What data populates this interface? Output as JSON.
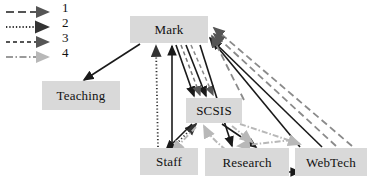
{
  "figure": {
    "type": "directed-graph-diagram",
    "background": "#ffffff",
    "node_fill": "#d9d9d9",
    "edge_dark": "#1a1a1a",
    "edge_gray": "#9a9a9a",
    "edge_light_gray": "#b8b8b8"
  },
  "legend": {
    "entries": [
      {
        "label": "1",
        "style": "long-dash",
        "color": "#555555"
      },
      {
        "label": "2",
        "style": "dotted",
        "color": "#333333"
      },
      {
        "label": "3",
        "style": "dashed",
        "color": "#555555"
      },
      {
        "label": "4",
        "style": "dash-dot",
        "color": "#9a9a9a"
      }
    ]
  },
  "nodes": [
    {
      "id": "mark",
      "label": "Mark",
      "x": 130,
      "y": 16,
      "w": 78,
      "h": 27
    },
    {
      "id": "teaching",
      "label": "Teaching",
      "x": 42,
      "y": 81,
      "w": 78,
      "h": 29
    },
    {
      "id": "scsis",
      "label": "SCSIS",
      "x": 186,
      "y": 98,
      "w": 56,
      "h": 25
    },
    {
      "id": "staff",
      "label": "Staff",
      "x": 140,
      "y": 148,
      "w": 58,
      "h": 27
    },
    {
      "id": "research",
      "label": "Research",
      "x": 205,
      "y": 148,
      "w": 84,
      "h": 28
    },
    {
      "id": "webtech",
      "label": "WebTech",
      "x": 295,
      "y": 148,
      "w": 72,
      "h": 28
    }
  ],
  "edges": [
    {
      "from": "mark",
      "to": "teaching",
      "style": "solid",
      "color": "#1a1a1a"
    },
    {
      "from": "staff",
      "to": "mark",
      "style": "solid",
      "color": "#1a1a1a"
    },
    {
      "from": "staff",
      "to": "mark",
      "style": "dotted",
      "color": "#333333"
    },
    {
      "from": "scsis",
      "to": "mark",
      "style": "dotted",
      "color": "#333333"
    },
    {
      "from": "mark",
      "to": "scsis",
      "style": "solid",
      "color": "#1a1a1a"
    },
    {
      "from": "mark",
      "to": "scsis",
      "style": "dashed",
      "color": "#555555"
    },
    {
      "from": "mark",
      "to": "research",
      "style": "solid",
      "color": "#1a1a1a"
    },
    {
      "from": "webtech",
      "to": "mark",
      "style": "solid",
      "color": "#1a1a1a"
    },
    {
      "from": "webtech",
      "to": "mark",
      "style": "long-dash",
      "color": "#555555"
    },
    {
      "from": "research",
      "to": "mark",
      "style": "long-dash",
      "color": "#555555"
    },
    {
      "from": "scsis",
      "to": "staff",
      "style": "solid",
      "color": "#1a1a1a"
    },
    {
      "from": "scsis",
      "to": "research",
      "style": "solid",
      "color": "#1a1a1a"
    },
    {
      "from": "scsis",
      "to": "staff",
      "style": "dash-dot",
      "color": "#b8b8b8"
    },
    {
      "from": "research",
      "to": "scsis",
      "style": "dash-dot",
      "color": "#b8b8b8"
    },
    {
      "from": "webtech",
      "to": "research",
      "style": "dash-dot",
      "color": "#b8b8b8"
    },
    {
      "from": "research",
      "to": "webtech",
      "style": "solid",
      "color": "#1a1a1a"
    }
  ]
}
